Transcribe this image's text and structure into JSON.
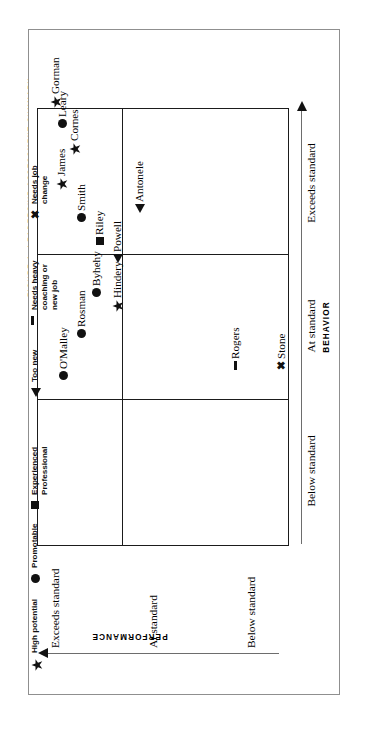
{
  "figure": {
    "caption": "FIGURE 1. LEADERSHIP ASSESSMENT SUMMARY"
  },
  "axes": {
    "y_axis_title": "PERFORMANCE",
    "x_axis_title": "BEHAVIOR",
    "y_ticks": [
      "Exceeds standard",
      "At standard",
      "Below standard"
    ],
    "x_ticks": [
      "Below standard",
      "At standard",
      "Exceeds standard"
    ]
  },
  "legend": {
    "items": [
      {
        "marker": "star",
        "marker_name": "star-marker-icon",
        "label": "High potential"
      },
      {
        "marker": "circle",
        "marker_name": "circle-marker-icon",
        "label": "Promotable"
      },
      {
        "marker": "square",
        "marker_name": "square-marker-icon",
        "label": "Experienced\nProfessional"
      },
      {
        "marker": "triangle",
        "marker_name": "triangle-marker-icon",
        "label": "Too new"
      },
      {
        "marker": "dash",
        "marker_name": "dash-marker-icon",
        "label": "Needs heavy\ncoaching or\nnew job"
      },
      {
        "marker": "x",
        "marker_name": "x-marker-icon",
        "label": "Needs job\nchange"
      }
    ]
  },
  "chart_data": {
    "type": "scatter",
    "title": "FIGURE 1. LEADERSHIP ASSESSMENT SUMMARY",
    "xlabel": "BEHAVIOR",
    "ylabel": "PERFORMANCE",
    "x_categories": [
      "Below standard",
      "At standard",
      "Exceeds standard"
    ],
    "y_categories": [
      "Below standard",
      "At standard",
      "Exceeds standard"
    ],
    "grid": true,
    "legend_position": "top-right",
    "points": [
      {
        "name": "Rogers",
        "marker": "dash",
        "behavior": "Below standard",
        "performance": "Exceeds standard"
      },
      {
        "name": "Stone",
        "marker": "x",
        "behavior": "Below standard",
        "performance": "Below standard"
      },
      {
        "name": "Hindery",
        "marker": "star",
        "behavior": "At standard",
        "performance": "At standard"
      },
      {
        "name": "O'Malley",
        "marker": "circle",
        "behavior": "At standard",
        "performance": "Exceeds standard"
      },
      {
        "name": "Rosman",
        "marker": "circle",
        "behavior": "At standard",
        "performance": "Exceeds standard"
      },
      {
        "name": "Byhehy",
        "marker": "circle",
        "behavior": "At standard",
        "performance": "Exceeds standard"
      },
      {
        "name": "Powell",
        "marker": "triangle",
        "behavior": "At standard",
        "performance": "At standard"
      },
      {
        "name": "Smith",
        "marker": "circle",
        "behavior": "Exceeds standard",
        "performance": "Exceeds standard"
      },
      {
        "name": "James",
        "marker": "star",
        "behavior": "Exceeds standard",
        "performance": "Exceeds standard"
      },
      {
        "name": "Cornes",
        "marker": "star",
        "behavior": "Exceeds standard",
        "performance": "Exceeds standard"
      },
      {
        "name": "Leary",
        "marker": "circle",
        "behavior": "Exceeds standard",
        "performance": "Exceeds standard"
      },
      {
        "name": "Gorman",
        "marker": "star",
        "behavior": "Exceeds standard",
        "performance": "Exceeds standard"
      },
      {
        "name": "Riley",
        "marker": "square",
        "behavior": "Exceeds standard",
        "performance": "Exceeds standard"
      },
      {
        "name": "Antonele",
        "marker": "triangle",
        "behavior": "Exceeds standard",
        "performance": "At standard"
      }
    ]
  },
  "points_render": [
    {
      "name": "Rogers",
      "marker": "dash",
      "left": 175,
      "top": 192
    },
    {
      "name": "Stone",
      "marker": "x",
      "left": 175,
      "top": 238
    },
    {
      "name": "Hindery",
      "marker": "star",
      "left": 233,
      "top": 74
    },
    {
      "name": "O'Malley",
      "marker": "circle",
      "left": 165,
      "top": 20
    },
    {
      "name": "Rosman",
      "marker": "circle",
      "left": 207,
      "top": 38
    },
    {
      "name": "Byhehy",
      "marker": "circle",
      "left": 248,
      "top": 53
    },
    {
      "name": "Powell",
      "marker": "triangle",
      "left": 282,
      "top": 74
    },
    {
      "name": "Smith",
      "marker": "circle",
      "left": 323,
      "top": 38
    },
    {
      "name": "James",
      "marker": "star",
      "left": 355,
      "top": 18
    },
    {
      "name": "Cornes",
      "marker": "star",
      "left": 390,
      "top": 31
    },
    {
      "name": "Leary",
      "marker": "circle",
      "left": 417,
      "top": 19
    },
    {
      "name": "Gorman",
      "marker": "star",
      "left": 437,
      "top": 12
    },
    {
      "name": "Riley",
      "marker": "square",
      "left": 300,
      "top": 56
    },
    {
      "name": "Antonele",
      "marker": "triangle",
      "left": 332,
      "top": 96
    }
  ],
  "legend_render": [
    {
      "i": 0,
      "left": 16,
      "top": 2
    },
    {
      "i": 1,
      "left": 104,
      "top": 2
    },
    {
      "i": 2,
      "left": 178,
      "top": 2
    },
    {
      "i": 3,
      "left": 290,
      "top": 2
    },
    {
      "i": 4,
      "left": 362,
      "top": 2
    },
    {
      "i": 5,
      "left": 468,
      "top": 2
    }
  ]
}
